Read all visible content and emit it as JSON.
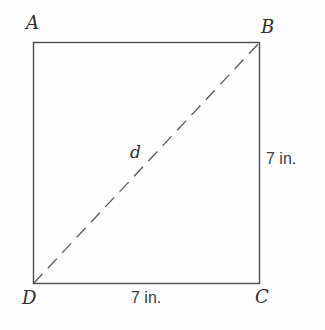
{
  "figure": {
    "type": "geometry-diagram",
    "vertices": {
      "top_left": "A",
      "top_right": "B",
      "bottom_right": "C",
      "bottom_left": "D"
    },
    "diagonal": {
      "label": "d",
      "from": "D",
      "to": "B",
      "style": "dashed"
    },
    "side_labels": {
      "right": "7 in.",
      "bottom": "7 in."
    },
    "colors": {
      "line": "#4d4d4d",
      "dashed_line": "#5a5a5a",
      "text": "#2f2f2f",
      "background": "#fefefe"
    }
  }
}
